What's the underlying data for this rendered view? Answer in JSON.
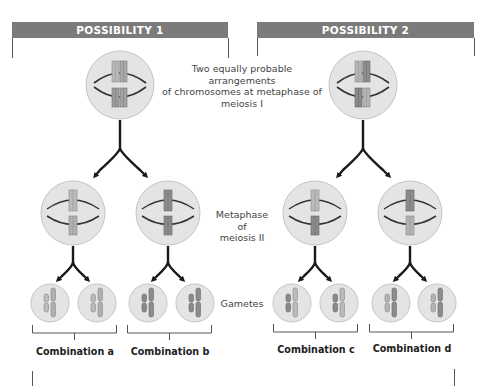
{
  "possibilities": [
    {
      "title": "POSSIBILITY 1",
      "combinations": [
        "Combination a",
        "Combination b"
      ]
    },
    {
      "title": "POSSIBILITY 2",
      "combinations": [
        "Combination c",
        "Combination d"
      ]
    }
  ],
  "stage_labels": {
    "metaphase_1": [
      "Two equally probable arrangements",
      "of chromosomes at metaphase of",
      "meiosis I"
    ],
    "metaphase_2": [
      "Metaphase of",
      "meiosis II"
    ],
    "gametes": "Gametes"
  },
  "colors": {
    "header_bg": "#7b7b7b",
    "cell_fill": "#e4e4e4",
    "cell_stroke": "#c4c4c4",
    "chromosome_light": "#b9b9b9",
    "chromosome_dark": "#7f7f7f",
    "spindle": "#333333",
    "arrow": "#1a1a1a"
  }
}
